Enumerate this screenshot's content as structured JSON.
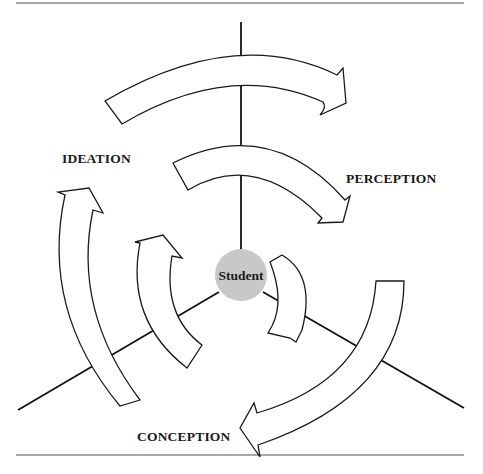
{
  "diagram": {
    "center": {
      "label": "Student",
      "fill": "#c8c8c8"
    },
    "labels": {
      "ideation": "IDEATION",
      "perception": "PERCEPTION",
      "conception": "CONCEPTION"
    },
    "axes": [
      "vertical-top",
      "lower-left",
      "lower-right"
    ],
    "arrows": {
      "outer": [
        "ideation-to-perception",
        "perception-to-conception",
        "conception-to-ideation"
      ],
      "inner": [
        "ideation-to-perception",
        "perception-to-conception",
        "conception-to-ideation"
      ]
    },
    "direction": "clockwise"
  }
}
